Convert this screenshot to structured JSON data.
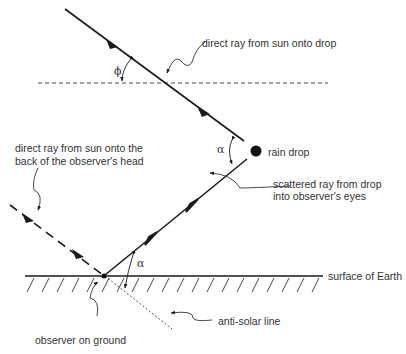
{
  "diagram": {
    "labels": {
      "direct_ray_drop": "direct ray from sun onto drop",
      "rain_drop": "rain drop",
      "scattered_ray_line1": "scattered ray from drop",
      "scattered_ray_line2": "into observer's eyes",
      "direct_ray_head_line1": "direct ray from sun onto the",
      "direct_ray_head_line2": "back of the observer's head",
      "surface": "surface of Earth",
      "anti_solar": "anti-solar line",
      "observer": "observer on ground"
    },
    "symbols": {
      "phi": "ϕ",
      "alpha_drop": "α",
      "alpha_ground": "α"
    },
    "colors": {
      "line": "#1a1a1a",
      "text": "#333333",
      "background": "#ffffff"
    }
  }
}
